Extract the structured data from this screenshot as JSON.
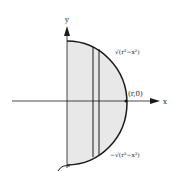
{
  "diagram": {
    "type": "semicircle-region-with-strip",
    "axes": {
      "x_label": "x",
      "y_label": "y"
    },
    "labels": {
      "top_curve": "√(r²−x²)",
      "bottom_curve": "−√(r²−x²)",
      "point": "(r,0)"
    },
    "colors": {
      "fill": "#e6e6e6",
      "stroke": "#1a1a1a"
    }
  }
}
